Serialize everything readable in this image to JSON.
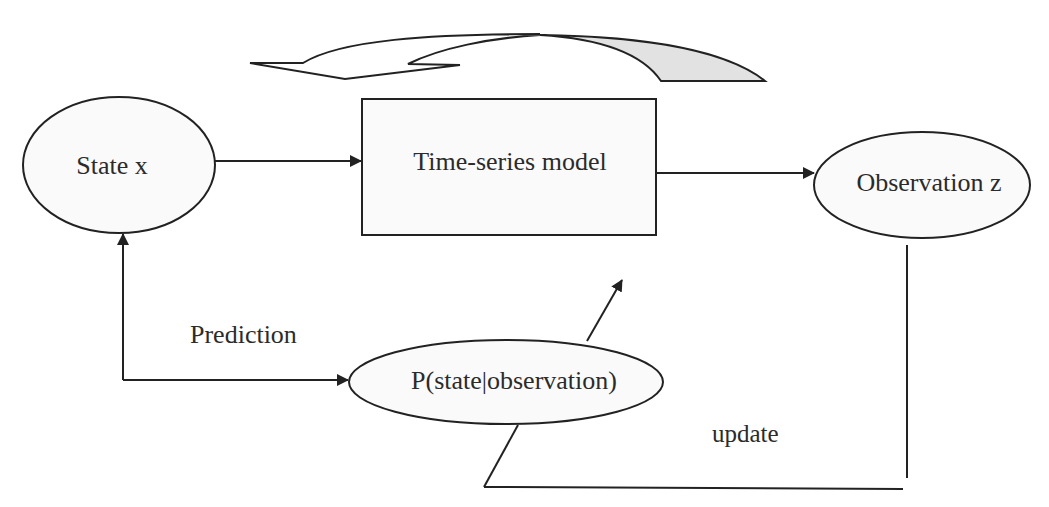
{
  "diagram": {
    "nodes": {
      "state": {
        "label": "State x",
        "shape": "ellipse"
      },
      "model": {
        "label": "Time-series model",
        "shape": "rectangle"
      },
      "observation": {
        "label": "Observation z",
        "shape": "ellipse"
      },
      "posterior": {
        "label": "P(state|observation)",
        "shape": "ellipse"
      }
    },
    "edge_labels": {
      "prediction": "Prediction",
      "update": "update"
    },
    "edges": [
      {
        "from": "State x",
        "to": "Time-series model"
      },
      {
        "from": "Time-series model",
        "to": "Observation z"
      },
      {
        "from": "P(state|observation)",
        "to": "State x",
        "label": "Prediction",
        "bidirectional": true
      },
      {
        "from": "Observation z",
        "to": "P(state|observation)",
        "label": "update"
      },
      {
        "from": "P(state|observation)",
        "to": "Time-series model"
      }
    ],
    "decorations": {
      "cycle_arrow": {
        "description": "curved feedback arrow above the model",
        "fill": "#e2e2e2"
      }
    },
    "colors": {
      "stroke": "#222222",
      "text": "#2b2b2b",
      "node_fill": "#fafafa",
      "arrow_shade": "#e2e2e2"
    }
  }
}
